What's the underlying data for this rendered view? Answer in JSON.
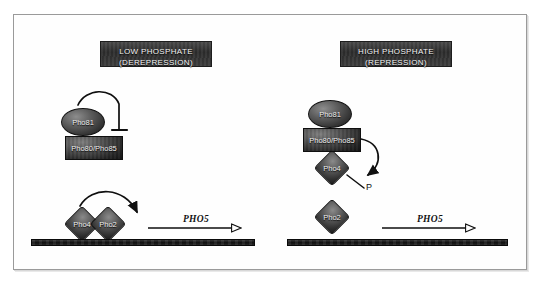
{
  "figure": {
    "frame": {
      "border_color": "#9a9a9a"
    }
  },
  "panels": [
    {
      "id": "low-phosphate",
      "header": {
        "line1": "LOW PHOSPHATE",
        "line2": "(DEREPRESSION)"
      },
      "nodes": {
        "pho81": "Pho81",
        "pho80_pho85": "Pho80/Pho85",
        "pho4": "Pho4",
        "pho2": "Pho2"
      },
      "gene": "PHO5"
    },
    {
      "id": "high-phosphate",
      "header": {
        "line1": "HIGH PHOSPHATE",
        "line2": "(REPRESSION)"
      },
      "nodes": {
        "pho81": "Pho81",
        "pho80_pho85": "Pho80/Pho85",
        "pho4": "Pho4",
        "pho2": "Pho2",
        "phosphate": "P"
      },
      "gene": "PHO5"
    }
  ],
  "colors": {
    "plaque_fill": "#2c2c2c",
    "plaque_text": "#f2f2f2",
    "protein_fill": "#4b4b4b",
    "dna_fill": "#111111",
    "stroke": "#111111",
    "page_background": "#ffffff"
  }
}
